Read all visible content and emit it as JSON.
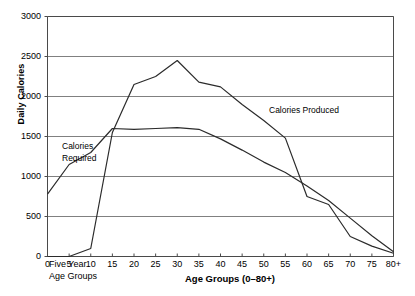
{
  "chart_data": {
    "type": "line",
    "title": "",
    "xlabel": "Age Groups (0–80+)",
    "ylabel": "Daily Calories",
    "xlim": [
      0,
      80
    ],
    "ylim": [
      0,
      3000
    ],
    "grid": "horizontal",
    "legend_position": "inline-annotations",
    "categories": [
      "0",
      "5",
      "10",
      "15",
      "20",
      "25",
      "30",
      "35",
      "40",
      "45",
      "50",
      "55",
      "60",
      "65",
      "70",
      "75",
      "80+"
    ],
    "ytick_labels": [
      "0",
      "500",
      "1000",
      "1500",
      "2000",
      "2500",
      "3000"
    ],
    "ytick_values": [
      0,
      500,
      1000,
      1500,
      2000,
      2500,
      3000
    ],
    "corner_note_line1": "Five Year",
    "corner_note_line2": "Age Groups",
    "series": [
      {
        "name": "Calories Required",
        "label_line1": "Calories",
        "label_line2": "Required",
        "color": "#2b2b2b",
        "values": [
          780,
          1150,
          1300,
          1600,
          1590,
          1600,
          1610,
          1590,
          1470,
          1330,
          1180,
          1050,
          880,
          700,
          480,
          260,
          60
        ]
      },
      {
        "name": "Calories Produced",
        "label": "Calories Produced",
        "color": "#2b2b2b",
        "values": [
          0,
          0,
          100,
          1550,
          2150,
          2250,
          2450,
          2180,
          2120,
          1900,
          1700,
          1480,
          750,
          650,
          250,
          130,
          40
        ]
      }
    ]
  },
  "annotations": {
    "produced_label": "Calories Produced",
    "required_label_line1": "Calories",
    "required_label_line2": "Required"
  }
}
